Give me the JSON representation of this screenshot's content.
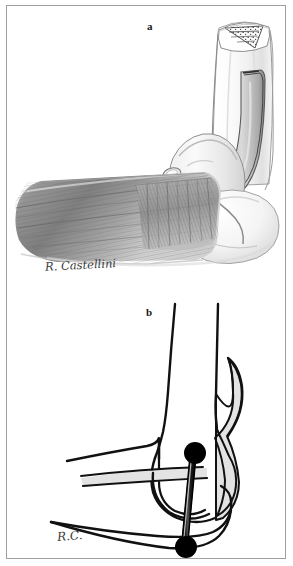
{
  "figure": {
    "panel_count": 2,
    "border_color": "#9e9e9e",
    "background_color": "#ffffff"
  },
  "panel_a": {
    "label": "a",
    "signature": "R. Castellini",
    "description": "Shaded anatomical drawing of a flexed elbow showing the distal humerus with cut cross-section, the olecranon, and the overlying muscle/tendon fibers",
    "style": "pencil-wash halftone",
    "structures": [
      {
        "name": "humerus-shaft",
        "label": "humerus"
      },
      {
        "name": "bone-cut-cross-section",
        "label": "cancellous bone cut surface"
      },
      {
        "name": "triceps-tendon",
        "label": "triceps tendon"
      },
      {
        "name": "olecranon",
        "label": "olecranon"
      },
      {
        "name": "muscle-fiber-mass",
        "label": "muscle fibers"
      },
      {
        "name": "forearm-bones",
        "label": "radius and ulna"
      }
    ],
    "colors": {
      "bone_outline": "#8c8c8c",
      "bone_fill": "#fbfbfb",
      "muscle_mid": "#9a9a9a",
      "muscle_dark": "#6f6f6f",
      "shadow": "#c8c8c8"
    }
  },
  "panel_b": {
    "label": "b",
    "signature": "R.C.",
    "description": "Line-art schematic of the same flexed elbow showing a fixation pin traversing the joint with two black markers at its ends",
    "style": "black line drawing with gray tendon shading",
    "structures": [
      {
        "name": "humerus-outline",
        "label": "humerus"
      },
      {
        "name": "triceps-tendon-band",
        "label": "triceps tendon"
      },
      {
        "name": "radius-ulna-outline",
        "label": "radius and ulna"
      },
      {
        "name": "olecranon-outline",
        "label": "olecranon"
      },
      {
        "name": "fixation-pin",
        "label": "fixation pin"
      },
      {
        "name": "marker-proximal",
        "label": "proximal marker"
      },
      {
        "name": "marker-distal",
        "label": "distal marker"
      }
    ],
    "markers": [
      {
        "id": "proximal",
        "cx": 188,
        "cy": 447,
        "r": 11,
        "color": "#000000"
      },
      {
        "id": "distal",
        "cx": 182,
        "cy": 541,
        "r": 11,
        "color": "#000000"
      }
    ],
    "colors": {
      "line": "#111111",
      "tendon_fill": "#e3e3e3",
      "pin": "#1a1a1a"
    }
  }
}
